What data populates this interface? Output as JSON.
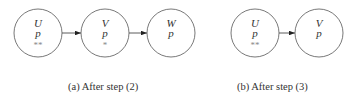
{
  "subfigures": [
    {
      "id": "a",
      "caption": "(a) After step (2)",
      "nodes": [
        {
          "name": "U",
          "prop": "p",
          "mark": "**",
          "cx": 38,
          "cy": 33
        },
        {
          "name": "V",
          "prop": "p",
          "mark": "*",
          "cx": 105,
          "cy": 33
        },
        {
          "name": "W",
          "prop": "p",
          "mark": "",
          "cx": 171,
          "cy": 33
        }
      ],
      "edges": [
        [
          "U",
          "V"
        ],
        [
          "V",
          "W"
        ]
      ]
    },
    {
      "id": "b",
      "caption": "(b) After step (3)",
      "nodes": [
        {
          "name": "U",
          "prop": "p",
          "mark": "**",
          "cx": 255,
          "cy": 33
        },
        {
          "name": "V",
          "prop": "p",
          "mark": "",
          "cx": 319,
          "cy": 33
        }
      ],
      "edges": [
        [
          "U",
          "V"
        ]
      ]
    }
  ],
  "style": {
    "stroke": "#555555",
    "radius": 24
  }
}
